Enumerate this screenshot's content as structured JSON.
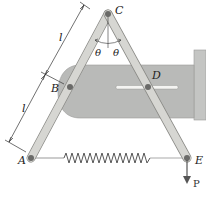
{
  "diagram": {
    "type": "mechanism",
    "points": {
      "A": {
        "label": "A"
      },
      "B": {
        "label": "B"
      },
      "C": {
        "label": "C"
      },
      "D": {
        "label": "D"
      },
      "E": {
        "label": "E"
      }
    },
    "dimensions": {
      "upper_length": "l",
      "lower_length": "l"
    },
    "angles": {
      "left": "θ",
      "right": "θ"
    },
    "load": {
      "label": "P"
    },
    "colors": {
      "bar_fill": "#d6d6d2",
      "bar_stroke": "#8a8a86",
      "plate_fill": "#b9bab8",
      "wall_fill": "#c4c5c3",
      "pin": "#6a6a68",
      "spring": "#555555"
    }
  }
}
